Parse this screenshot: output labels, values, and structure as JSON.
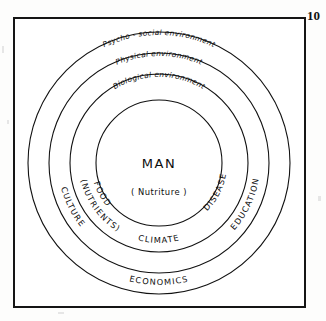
{
  "page": {
    "number": "10",
    "figure_title": "Man and his environment — concentric rings diagram"
  },
  "center": {
    "title": "MAN",
    "subtitle": "( Nutriture )"
  },
  "rings": [
    {
      "id": "psycho-social",
      "label": "Psycho - social   environment",
      "radius": 131,
      "level": 4
    },
    {
      "id": "physical",
      "label": "Physical   environment",
      "radius": 110,
      "level": 3
    },
    {
      "id": "biological",
      "label": "Biological   environment",
      "radius": 89,
      "level": 2
    },
    {
      "id": "man",
      "label": "MAN",
      "radius": 63,
      "level": 1
    }
  ],
  "factors": [
    {
      "id": "food",
      "label": "FOOD",
      "ring": "biological"
    },
    {
      "id": "nutrients",
      "label": "(NUTRIENTS)",
      "ring": "biological"
    },
    {
      "id": "disease",
      "label": "DISEASE",
      "ring": "biological"
    },
    {
      "id": "climate",
      "label": "CLIMATE",
      "ring": "physical"
    },
    {
      "id": "culture",
      "label": "CULTURE",
      "ring": "psycho-social"
    },
    {
      "id": "education",
      "label": "EDUCATION",
      "ring": "psycho-social"
    },
    {
      "id": "economics",
      "label": "ECONOMICS",
      "ring": "psycho-social-outer"
    }
  ],
  "colors": {
    "ink": "#111111",
    "paper": "#ffffff",
    "frame": "#151515"
  }
}
